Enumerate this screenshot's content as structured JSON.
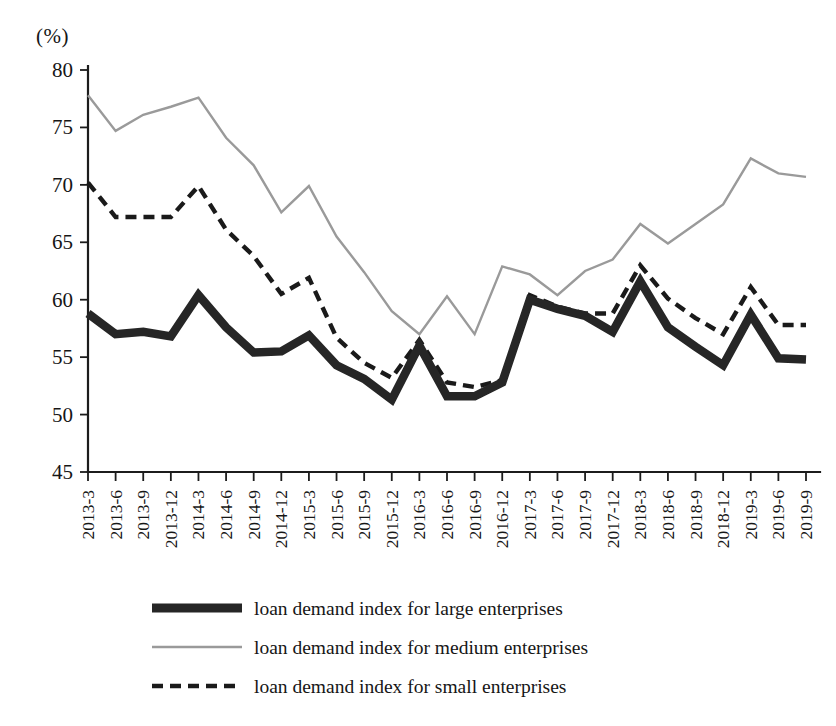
{
  "chart_data": {
    "type": "line",
    "title": "",
    "subtitle": "",
    "xlabel": "",
    "ylabel": "(%)",
    "unit_label": "(%)",
    "ylim": [
      45,
      80
    ],
    "yticks": [
      45,
      50,
      55,
      60,
      65,
      70,
      75,
      80
    ],
    "grid": false,
    "legend_position": "bottom",
    "categories": [
      "2013-3",
      "2013-6",
      "2013-9",
      "2013-12",
      "2014-3",
      "2014-6",
      "2014-9",
      "2014-12",
      "2015-3",
      "2015-6",
      "2015-9",
      "2015-12",
      "2016-3",
      "2016-6",
      "2016-9",
      "2016-12",
      "2017-3",
      "2017-6",
      "2017-9",
      "2017-12",
      "2018-3",
      "2018-6",
      "2018-9",
      "2018-12",
      "2019-3",
      "2019-6",
      "2019-9"
    ],
    "series": [
      {
        "name": "loan demand index for large enterprises",
        "style": "thick-solid",
        "color": "#262626",
        "values": [
          58.8,
          57.0,
          57.2,
          56.8,
          60.4,
          57.6,
          55.4,
          55.5,
          56.9,
          54.3,
          53.1,
          51.3,
          56.0,
          51.6,
          51.6,
          52.8,
          60.0,
          59.2,
          58.6,
          57.2,
          61.6,
          57.6,
          55.9,
          54.3,
          58.7,
          54.9,
          54.8
        ]
      },
      {
        "name": "loan demand index for medium enterprises",
        "style": "thin-solid",
        "color": "#9a9a9a",
        "values": [
          77.8,
          74.7,
          76.1,
          76.8,
          77.6,
          74.1,
          71.7,
          67.6,
          69.9,
          65.5,
          62.4,
          59.0,
          57.0,
          60.3,
          57.2,
          56.0,
          57.0,
          62.9,
          62.2,
          60.4,
          62.5,
          63.5,
          66.6,
          64.9,
          66.6,
          68.3,
          70.2
        ]
      },
      {
        "name": "loan demand index for small enterprises",
        "style": "dashed",
        "color": "#1a1a1a",
        "values": [
          70.2,
          67.2,
          67.2,
          67.2,
          69.9,
          66.1,
          63.8,
          60.5,
          61.9,
          56.7,
          54.5,
          53.2,
          56.5,
          52.8,
          52.4,
          53.0,
          60.4,
          59.4,
          58.8,
          58.8,
          63.0,
          60.1,
          58.4,
          57.0,
          61.1,
          57.8,
          57.8
        ]
      }
    ],
    "medium_tail": [
      57.0,
      62.9,
      62.2,
      60.4,
      62.5,
      63.5,
      66.6,
      64.9,
      66.6,
      68.3,
      72.3,
      71.0,
      70.7
    ]
  },
  "legend": {
    "items": [
      {
        "label": "loan demand index for large enterprises",
        "swatch": "thick-solid-line-icon"
      },
      {
        "label": "loan demand index for medium enterprises",
        "swatch": "thin-solid-line-icon"
      },
      {
        "label": "loan demand index for small enterprises",
        "swatch": "dashed-line-icon"
      }
    ]
  }
}
